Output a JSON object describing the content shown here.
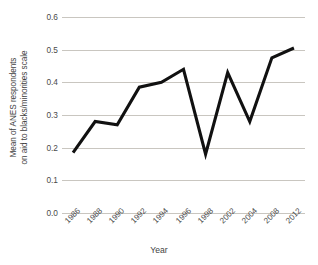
{
  "chart_data": {
    "type": "line",
    "title": "",
    "xlabel": "Year",
    "ylabel": "Mean of ANES respondents on aid to blacks/minorities scale",
    "ylabel_line1": "Mean of ANES respondents",
    "ylabel_line2": "on aid to blacks/minorities scale",
    "categories": [
      "1986",
      "1988",
      "1990",
      "1992",
      "1994",
      "1996",
      "1998",
      "2002",
      "2004",
      "2008",
      "2012"
    ],
    "values": [
      0.185,
      0.28,
      0.27,
      0.385,
      0.4,
      0.44,
      0.18,
      0.43,
      0.28,
      0.475,
      0.505
    ],
    "series": [
      {
        "name": "Mean of ANES respondents on aid to blacks/minorities scale",
        "values": [
          0.185,
          0.28,
          0.27,
          0.385,
          0.4,
          0.44,
          0.18,
          0.43,
          0.28,
          0.475,
          0.505
        ]
      }
    ],
    "ylim": [
      0.0,
      0.6
    ],
    "yticks": [
      "0.0",
      "0.1",
      "0.2",
      "0.3",
      "0.4",
      "0.5",
      "0.6"
    ],
    "ytick_values": [
      0.0,
      0.1,
      0.2,
      0.3,
      0.4,
      0.5,
      0.6
    ],
    "grid": true,
    "grid_color": "#c9c6c0",
    "line_color": "#111111",
    "legend": "none",
    "legend_position": "none"
  }
}
